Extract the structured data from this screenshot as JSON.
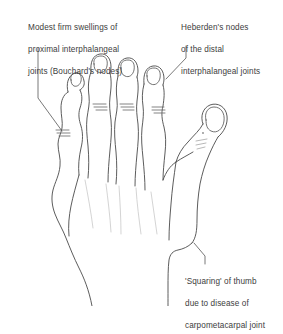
{
  "figure": {
    "background_color": "#ffffff",
    "line_color": "#4a4a4a",
    "text_color": "#3d3d3d"
  },
  "annotations": {
    "bouchard": {
      "name": "bouchard-nodes-label",
      "lines": [
        "Modest firm swellings of",
        "proximal interphalangeal",
        "joints (Bouchard's nodes)"
      ]
    },
    "heberden": {
      "name": "heberden-nodes-label",
      "lines": [
        "Heberden's nodes",
        "of the distal",
        "interphalangeal joints"
      ]
    },
    "squaring": {
      "name": "squaring-thumb-label",
      "lines": [
        "'Squaring' of thumb",
        "due to disease of",
        "carpometacarpal joint"
      ]
    }
  },
  "markers": {
    "joint_swellings": [
      {
        "name": "pip-little-finger",
        "x": 62,
        "y": 133,
        "lines": 3
      },
      {
        "name": "pip-ring-finger",
        "x": 100,
        "y": 107,
        "lines": 3
      },
      {
        "name": "pip-middle-finger",
        "x": 124,
        "y": 107,
        "lines": 3
      },
      {
        "name": "dip-index-finger",
        "x": 157,
        "y": 110,
        "lines": 3
      }
    ]
  }
}
